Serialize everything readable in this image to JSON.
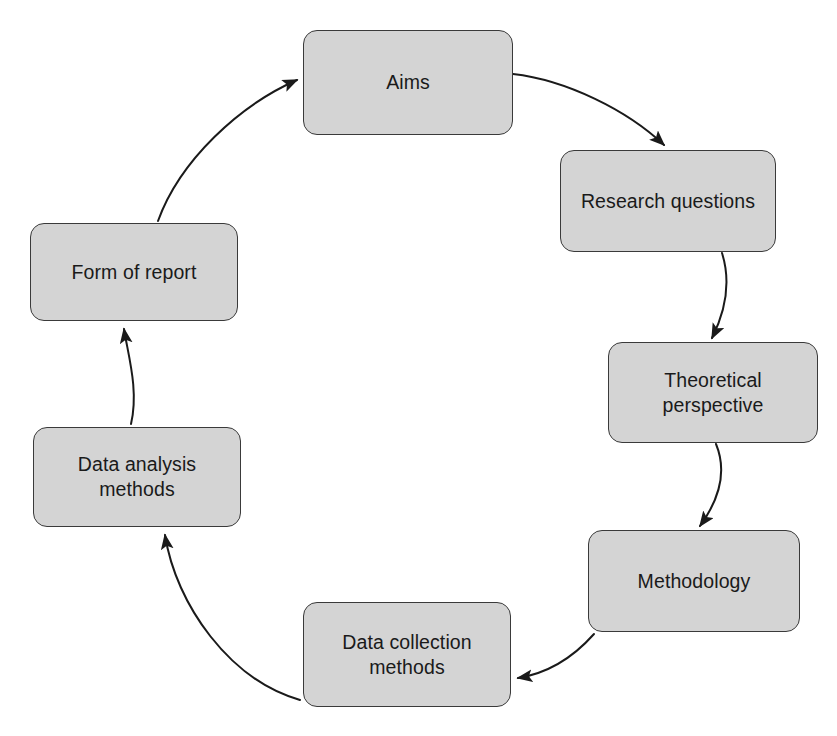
{
  "diagram": {
    "type": "cycle-flow-diagram",
    "direction": "clockwise",
    "canvas": {
      "width": 837,
      "height": 736,
      "background": "#ffffff"
    },
    "style": {
      "node_fill": "#d4d4d4",
      "node_stroke": "#3a3a3a",
      "text_color": "#1a1a1a",
      "arrow_color": "#1a1a1a"
    },
    "nodes": [
      {
        "id": "aims",
        "label": "Aims",
        "x": 303,
        "y": 30,
        "w": 210,
        "h": 105,
        "order": 1
      },
      {
        "id": "research-questions",
        "label": "Research questions",
        "x": 560,
        "y": 150,
        "w": 216,
        "h": 102,
        "order": 2
      },
      {
        "id": "theoretical-perspective",
        "label": "Theoretical\nperspective",
        "x": 608,
        "y": 342,
        "w": 210,
        "h": 101,
        "order": 3
      },
      {
        "id": "methodology",
        "label": "Methodology",
        "x": 588,
        "y": 530,
        "w": 212,
        "h": 102,
        "order": 4
      },
      {
        "id": "data-collection-methods",
        "label": "Data collection\nmethods",
        "x": 303,
        "y": 602,
        "w": 208,
        "h": 105,
        "order": 5
      },
      {
        "id": "data-analysis-methods",
        "label": "Data analysis\nmethods",
        "x": 33,
        "y": 427,
        "w": 208,
        "h": 100,
        "order": 6
      },
      {
        "id": "form-of-report",
        "label": "Form of report",
        "x": 30,
        "y": 223,
        "w": 208,
        "h": 98,
        "order": 7
      }
    ],
    "edges": [
      {
        "id": "aims-to-research-questions",
        "from": "aims",
        "to": "research-questions",
        "path": "M 513 74 C 566 80 627 110 664 145",
        "arrowhead": true
      },
      {
        "id": "research-questions-to-theoretical-perspective",
        "from": "research-questions",
        "to": "theoretical-perspective",
        "path": "M 722 253 C 733 288 722 318 712 338",
        "arrowhead": true
      },
      {
        "id": "theoretical-perspective-to-methodology",
        "from": "theoretical-perspective",
        "to": "methodology",
        "path": "M 716 444 C 730 478 713 508 700 526",
        "arrowhead": true
      },
      {
        "id": "methodology-to-data-collection-methods",
        "from": "methodology",
        "to": "data-collection-methods",
        "path": "M 594 634 C 570 661 543 674 518 678",
        "arrowhead": true
      },
      {
        "id": "data-collection-methods-to-data-analysis-methods",
        "from": "data-collection-methods",
        "to": "data-analysis-methods",
        "path": "M 300 700 C 230 680 176 605 165 535",
        "arrowhead": true
      },
      {
        "id": "data-analysis-methods-to-form-of-report",
        "from": "data-analysis-methods",
        "to": "form-of-report",
        "path": "M 131 424 C 139 390 128 355 124 329",
        "arrowhead": true
      },
      {
        "id": "form-of-report-to-aims",
        "from": "form-of-report",
        "to": "aims",
        "path": "M 158 221 C 180 160 240 105 297 80",
        "arrowhead": true
      }
    ]
  }
}
